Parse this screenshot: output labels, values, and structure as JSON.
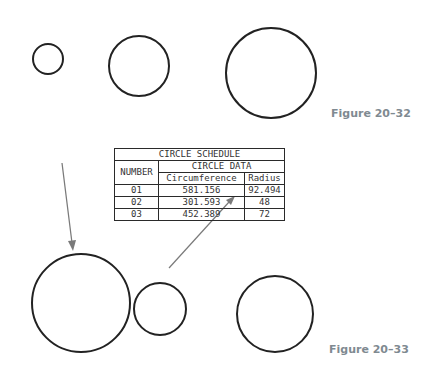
{
  "figures": [
    {
      "label": "Figure 20–32"
    },
    {
      "label": "Figure 20–33"
    }
  ],
  "top_circles": [
    {
      "cx": 48,
      "cy": 59,
      "r": 15
    },
    {
      "cx": 139,
      "cy": 66,
      "r": 30
    },
    {
      "cx": 271,
      "cy": 73,
      "r": 45
    }
  ],
  "bottom_circles": [
    {
      "cx": 81,
      "cy": 303,
      "r": 49
    },
    {
      "cx": 160,
      "cy": 309,
      "r": 26
    },
    {
      "cx": 275,
      "cy": 314,
      "r": 38
    }
  ],
  "table": {
    "title": "CIRCLE SCHEDULE",
    "group_header": "CIRCLE DATA",
    "number_header": "NUMBER",
    "columns": [
      "Circumference",
      "Radius"
    ],
    "rows": [
      {
        "number": "01",
        "circumference": "581.156",
        "radius": "92.494"
      },
      {
        "number": "02",
        "circumference": "301.593",
        "radius": "48"
      },
      {
        "number": "03",
        "circumference": "452.389",
        "radius": "72"
      }
    ]
  },
  "colors": {
    "line": "#222222",
    "leader": "#7a7a7a",
    "label": "#7f8a91"
  }
}
